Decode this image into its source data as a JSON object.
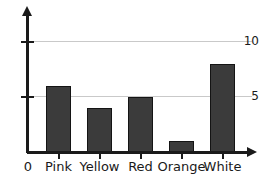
{
  "chart_data": {
    "type": "bar",
    "title": "",
    "xlabel": "",
    "ylabel": "",
    "categories": [
      "Pink",
      "Yellow",
      "Red",
      "Orange",
      "White"
    ],
    "values": [
      6,
      4,
      5,
      1,
      8
    ],
    "ylim": [
      0,
      12.5
    ],
    "yticks": [
      5,
      10
    ],
    "ytick_labels": [
      "5",
      "10"
    ],
    "origin_label": "0",
    "grid": true,
    "grid_axis": "y",
    "legend": false,
    "bar_color": "#3b3b3b",
    "bar_edge_color": "#141414",
    "gridline_color": "#c9c9c9",
    "axis_color": "#1a1a1a",
    "background_color": "#ffffff"
  },
  "axes": {
    "y_arrow_icon": "arrow-up-icon",
    "x_arrow_icon": "arrow-right-icon"
  }
}
